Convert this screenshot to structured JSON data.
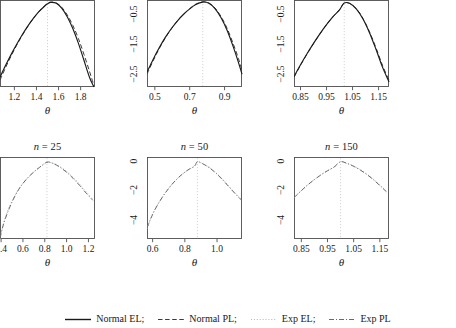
{
  "figure": {
    "axis_labels": {
      "y": "−log MLR (θ), −log ELR (θ)",
      "x": "θ"
    }
  },
  "legend": {
    "position": "bottom",
    "entries": [
      {
        "label": "Normal EL;",
        "style": "solid",
        "icon": "solid-line-icon",
        "color": "#1a1a1a"
      },
      {
        "label": "Normal PL;",
        "style": "dashed",
        "icon": "dashed-line-icon",
        "color": "#3a3a3a"
      },
      {
        "label": "Exp EL;",
        "style": "dotted",
        "icon": "dotted-line-icon",
        "color": "#b6b6b6"
      },
      {
        "label": "Exp PL",
        "style": "dashdot",
        "icon": "dashdot-line-icon",
        "color": "#6a6a6a"
      }
    ]
  },
  "chart_data": [
    {
      "id": "panel-top-n25",
      "type": "line",
      "title": "n = 25",
      "title_prefix": "n",
      "title_suffix": "= 25",
      "xlabel": "θ",
      "ylabel": "−log MLR (θ), −log ELR (θ)",
      "xlim": [
        1.07,
        1.93
      ],
      "ylim": [
        -2.95,
        -0.02
      ],
      "xticks": [
        1.2,
        1.4,
        1.6,
        1.8
      ],
      "xticklabels": [
        "1.2",
        "1.4",
        "1.6",
        "1.8"
      ],
      "yticks": [
        -2.5,
        -1.5,
        -0.5
      ],
      "yticklabels": [
        "-2.5",
        "-1.5",
        "-0.5"
      ],
      "grid": false,
      "vline": 1.5,
      "series": [
        {
          "name": "Normal EL;",
          "style": "solid",
          "color": "#1a1a1a",
          "x": [
            1.07,
            1.12,
            1.17,
            1.22,
            1.27,
            1.32,
            1.37,
            1.42,
            1.47,
            1.5,
            1.53,
            1.58,
            1.63,
            1.68,
            1.73,
            1.78,
            1.83,
            1.88,
            1.92
          ],
          "y": [
            -2.62,
            -2.23,
            -1.86,
            -1.52,
            -1.2,
            -0.91,
            -0.65,
            -0.42,
            -0.24,
            -0.15,
            -0.1,
            -0.13,
            -0.3,
            -0.59,
            -0.99,
            -1.48,
            -2.05,
            -2.62,
            -2.95
          ]
        },
        {
          "name": "Normal PL;",
          "style": "dashed",
          "color": "#3a3a3a",
          "x": [
            1.07,
            1.12,
            1.17,
            1.22,
            1.27,
            1.32,
            1.37,
            1.42,
            1.47,
            1.5,
            1.53,
            1.58,
            1.63,
            1.68,
            1.73,
            1.78,
            1.83,
            1.88,
            1.92
          ],
          "y": [
            -2.72,
            -2.3,
            -1.91,
            -1.55,
            -1.22,
            -0.92,
            -0.65,
            -0.42,
            -0.23,
            -0.14,
            -0.09,
            -0.12,
            -0.27,
            -0.53,
            -0.88,
            -1.32,
            -1.85,
            -2.42,
            -2.9
          ]
        }
      ]
    },
    {
      "id": "panel-top-n50",
      "type": "line",
      "title": "n = 50",
      "title_prefix": "n",
      "title_suffix": "= 50",
      "xlabel": "θ",
      "ylabel": "−log MLR (θ), −log ELR (θ)",
      "xlim": [
        0.455,
        1.0
      ],
      "ylim": [
        -2.95,
        -0.02
      ],
      "xticks": [
        0.5,
        0.7,
        0.9
      ],
      "xticklabels": [
        "0.5",
        "0.7",
        "0.9"
      ],
      "yticks": [
        -2.5,
        -1.5,
        -0.5
      ],
      "yticklabels": [
        "-2.5",
        "-1.5",
        "-0.5"
      ],
      "grid": false,
      "vline": 0.775,
      "series": [
        {
          "name": "Normal EL;",
          "style": "solid",
          "color": "#1a1a1a",
          "x": [
            0.455,
            0.49,
            0.525,
            0.56,
            0.595,
            0.63,
            0.665,
            0.7,
            0.735,
            0.775,
            0.81,
            0.845,
            0.88,
            0.915,
            0.95,
            0.98,
            1.0
          ],
          "y": [
            -2.45,
            -2.02,
            -1.63,
            -1.28,
            -0.98,
            -0.72,
            -0.5,
            -0.32,
            -0.17,
            -0.09,
            -0.13,
            -0.31,
            -0.62,
            -1.05,
            -1.6,
            -2.13,
            -2.52
          ]
        },
        {
          "name": "Normal PL;",
          "style": "dashed",
          "color": "#3a3a3a",
          "x": [
            0.455,
            0.49,
            0.525,
            0.56,
            0.595,
            0.63,
            0.665,
            0.7,
            0.735,
            0.775,
            0.81,
            0.845,
            0.88,
            0.915,
            0.95,
            0.98,
            1.0
          ],
          "y": [
            -2.52,
            -2.07,
            -1.66,
            -1.3,
            -0.99,
            -0.72,
            -0.5,
            -0.31,
            -0.16,
            -0.08,
            -0.12,
            -0.29,
            -0.58,
            -0.98,
            -1.5,
            -2.0,
            -2.38
          ]
        }
      ]
    },
    {
      "id": "panel-top-n150",
      "type": "line",
      "title": "n = 150",
      "title_prefix": "n",
      "title_suffix": "= 150",
      "xlabel": "θ",
      "ylabel": "−log MLR (θ), −log ELR (θ)",
      "xlim": [
        0.825,
        1.19
      ],
      "ylim": [
        -2.95,
        -0.02
      ],
      "xticks": [
        0.85,
        0.95,
        1.05,
        1.15
      ],
      "xticklabels": [
        "0.85",
        "0.95",
        "1.05",
        "1.15"
      ],
      "yticks": [
        -2.5,
        -1.5,
        -0.5
      ],
      "yticklabels": [
        "-2.5",
        "-1.5",
        "-0.5"
      ],
      "grid": false,
      "vline": 1.018,
      "series": [
        {
          "name": "Normal EL;",
          "style": "solid",
          "color": "#1a1a1a",
          "x": [
            0.825,
            0.85,
            0.875,
            0.9,
            0.925,
            0.95,
            0.975,
            1.0,
            1.018,
            1.04,
            1.065,
            1.09,
            1.115,
            1.14,
            1.165,
            1.19
          ],
          "y": [
            -2.6,
            -2.2,
            -1.83,
            -1.48,
            -1.15,
            -0.85,
            -0.58,
            -0.35,
            -0.12,
            -0.14,
            -0.33,
            -0.66,
            -1.12,
            -1.68,
            -2.28,
            -2.78
          ]
        },
        {
          "name": "Normal PL;",
          "style": "dashed",
          "color": "#3a3a3a",
          "x": [
            0.825,
            0.85,
            0.875,
            0.9,
            0.925,
            0.95,
            0.975,
            1.0,
            1.018,
            1.04,
            1.065,
            1.09,
            1.115,
            1.14,
            1.165,
            1.19
          ],
          "y": [
            -2.62,
            -2.22,
            -1.84,
            -1.49,
            -1.16,
            -0.85,
            -0.58,
            -0.34,
            -0.12,
            -0.14,
            -0.32,
            -0.64,
            -1.09,
            -1.63,
            -2.22,
            -2.72
          ]
        }
      ]
    },
    {
      "id": "panel-bottom-n25",
      "type": "line",
      "title": "n = 25",
      "title_prefix": "n",
      "title_suffix": "= 25",
      "xlabel": "θ",
      "ylabel": "−log MLR (θ), −log ELR (θ)",
      "xlim": [
        0.39,
        1.26
      ],
      "ylim": [
        -5.3,
        0.25
      ],
      "xticks": [
        0.4,
        0.6,
        0.8,
        1.0,
        1.2
      ],
      "xticklabels": [
        "0.4",
        "0.6",
        "0.8",
        "1.0",
        "1.2"
      ],
      "yticks": [
        -4,
        -2,
        0
      ],
      "yticklabels": [
        "-4",
        "-2",
        "0"
      ],
      "grid": false,
      "vline": 0.82,
      "series": [
        {
          "name": "Exp EL;",
          "style": "dotted",
          "color": "#b6b6b6",
          "x": [
            0.39,
            0.42,
            0.46,
            0.5,
            0.55,
            0.6,
            0.65,
            0.7,
            0.75,
            0.82,
            0.88,
            0.94,
            1.0,
            1.06,
            1.12,
            1.18,
            1.24
          ],
          "y": [
            -5.3,
            -4.3,
            -3.4,
            -2.72,
            -2.05,
            -1.53,
            -1.12,
            -0.78,
            -0.48,
            -0.12,
            -0.18,
            -0.4,
            -0.72,
            -1.12,
            -1.6,
            -2.1,
            -2.6
          ]
        },
        {
          "name": "Exp PL",
          "style": "dashdot",
          "color": "#6a6a6a",
          "x": [
            0.39,
            0.42,
            0.46,
            0.5,
            0.55,
            0.6,
            0.65,
            0.7,
            0.75,
            0.82,
            0.88,
            0.94,
            1.0,
            1.06,
            1.12,
            1.18,
            1.24
          ],
          "y": [
            -5.25,
            -4.35,
            -3.5,
            -2.8,
            -2.08,
            -1.54,
            -1.11,
            -0.76,
            -0.46,
            -0.1,
            -0.2,
            -0.45,
            -0.78,
            -1.2,
            -1.68,
            -2.2,
            -2.68
          ]
        }
      ]
    },
    {
      "id": "panel-bottom-n50",
      "type": "line",
      "title": "n = 50",
      "title_prefix": "n",
      "title_suffix": "= 50",
      "xlabel": "θ",
      "ylabel": "−log MLR (θ), −log ELR (θ)",
      "xlim": [
        0.565,
        1.155
      ],
      "ylim": [
        -5.3,
        0.25
      ],
      "xticks": [
        0.6,
        0.8,
        1.0
      ],
      "xticklabels": [
        "0.6",
        "0.8",
        "1.0"
      ],
      "yticks": [
        -4,
        -2,
        0
      ],
      "yticklabels": [
        "-4",
        "-2",
        "0"
      ],
      "grid": false,
      "vline": 0.878,
      "series": [
        {
          "name": "Exp EL;",
          "style": "dotted",
          "color": "#b6b6b6",
          "x": [
            0.565,
            0.59,
            0.62,
            0.66,
            0.7,
            0.74,
            0.78,
            0.82,
            0.86,
            0.878,
            0.91,
            0.95,
            0.99,
            1.03,
            1.07,
            1.11,
            1.15
          ],
          "y": [
            -4.6,
            -3.85,
            -3.15,
            -2.45,
            -1.86,
            -1.37,
            -0.96,
            -0.63,
            -0.38,
            -0.08,
            -0.19,
            -0.44,
            -0.78,
            -1.2,
            -1.68,
            -2.16,
            -2.6
          ]
        },
        {
          "name": "Exp PL",
          "style": "dashdot",
          "color": "#6a6a6a",
          "x": [
            0.565,
            0.59,
            0.62,
            0.66,
            0.7,
            0.74,
            0.78,
            0.82,
            0.86,
            0.878,
            0.91,
            0.95,
            0.99,
            1.03,
            1.07,
            1.11,
            1.15
          ],
          "y": [
            -4.55,
            -3.88,
            -3.2,
            -2.48,
            -1.87,
            -1.36,
            -0.95,
            -0.62,
            -0.36,
            -0.07,
            -0.2,
            -0.46,
            -0.81,
            -1.24,
            -1.72,
            -2.2,
            -2.65
          ]
        }
      ]
    },
    {
      "id": "panel-bottom-n150",
      "type": "line",
      "title": "n = 150",
      "title_prefix": "n",
      "title_suffix": "= 150",
      "xlabel": "θ",
      "ylabel": "−log MLR (θ), −log ELR (θ)",
      "xlim": [
        0.822,
        1.185
      ],
      "ylim": [
        -5.3,
        0.25
      ],
      "xticks": [
        0.85,
        0.95,
        1.05,
        1.15
      ],
      "xticklabels": [
        "0.85",
        "0.95",
        "1.05",
        "1.15"
      ],
      "yticks": [
        -4,
        -2,
        0
      ],
      "yticklabels": [
        "-4",
        "-2",
        "0"
      ],
      "grid": false,
      "vline": 1.0,
      "series": [
        {
          "name": "Exp EL;",
          "style": "dotted",
          "color": "#b6b6b6",
          "x": [
            0.822,
            0.85,
            0.875,
            0.9,
            0.925,
            0.95,
            0.975,
            1.0,
            1.025,
            1.05,
            1.075,
            1.1,
            1.125,
            1.15,
            1.175
          ],
          "y": [
            -2.52,
            -2.02,
            -1.62,
            -1.27,
            -0.95,
            -0.68,
            -0.44,
            -0.08,
            -0.18,
            -0.36,
            -0.6,
            -0.9,
            -1.25,
            -1.64,
            -2.05
          ]
        },
        {
          "name": "Exp PL",
          "style": "dashdot",
          "color": "#6a6a6a",
          "x": [
            0.822,
            0.85,
            0.875,
            0.9,
            0.925,
            0.95,
            0.975,
            1.0,
            1.025,
            1.05,
            1.075,
            1.1,
            1.125,
            1.15,
            1.175
          ],
          "y": [
            -2.5,
            -2.03,
            -1.63,
            -1.28,
            -0.96,
            -0.68,
            -0.43,
            -0.07,
            -0.19,
            -0.38,
            -0.63,
            -0.93,
            -1.28,
            -1.68,
            -2.1
          ]
        }
      ]
    }
  ]
}
